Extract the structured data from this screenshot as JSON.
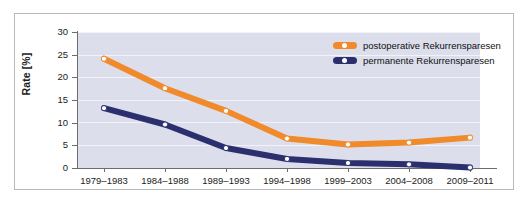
{
  "chart_data": {
    "type": "line",
    "title": "",
    "xlabel": "",
    "ylabel": "Rate [%]",
    "ylim": [
      0,
      30
    ],
    "yticks": [
      0,
      5,
      10,
      15,
      20,
      25,
      30
    ],
    "grid": true,
    "legend_position": "top-right",
    "categories": [
      "1979–1983",
      "1984–1988",
      "1989–1993",
      "1994–1998",
      "1999–2003",
      "2004–2008",
      "2009–2011"
    ],
    "series": [
      {
        "name": "postoperative Rekurrensparesen",
        "color": "#F08A2B",
        "marker": "white-dot",
        "values": [
          24.1,
          17.6,
          12.6,
          6.5,
          5.2,
          5.6,
          6.7
        ]
      },
      {
        "name": "permanente Rekurrensparesen",
        "color": "#2B2F6E",
        "marker": "white-dot",
        "values": [
          13.2,
          9.6,
          4.4,
          2.0,
          1.1,
          0.8,
          0.1
        ]
      }
    ]
  },
  "legend": {
    "items": [
      {
        "label": "postoperative Rekurrensparesen",
        "color": "#F08A2B"
      },
      {
        "label": "permanente Rekurrensparesen",
        "color": "#2B2F6E"
      }
    ]
  },
  "colors": {
    "plot_background": "#dcdeec",
    "figure_background": "#ffffff",
    "frame_border": "#b9b9b9",
    "axis": "#6d6d6d",
    "gridline": "#f2f3f8",
    "text": "#1b1b1b",
    "series_orange": "#F08A2B",
    "series_navy": "#2B2F6E"
  }
}
